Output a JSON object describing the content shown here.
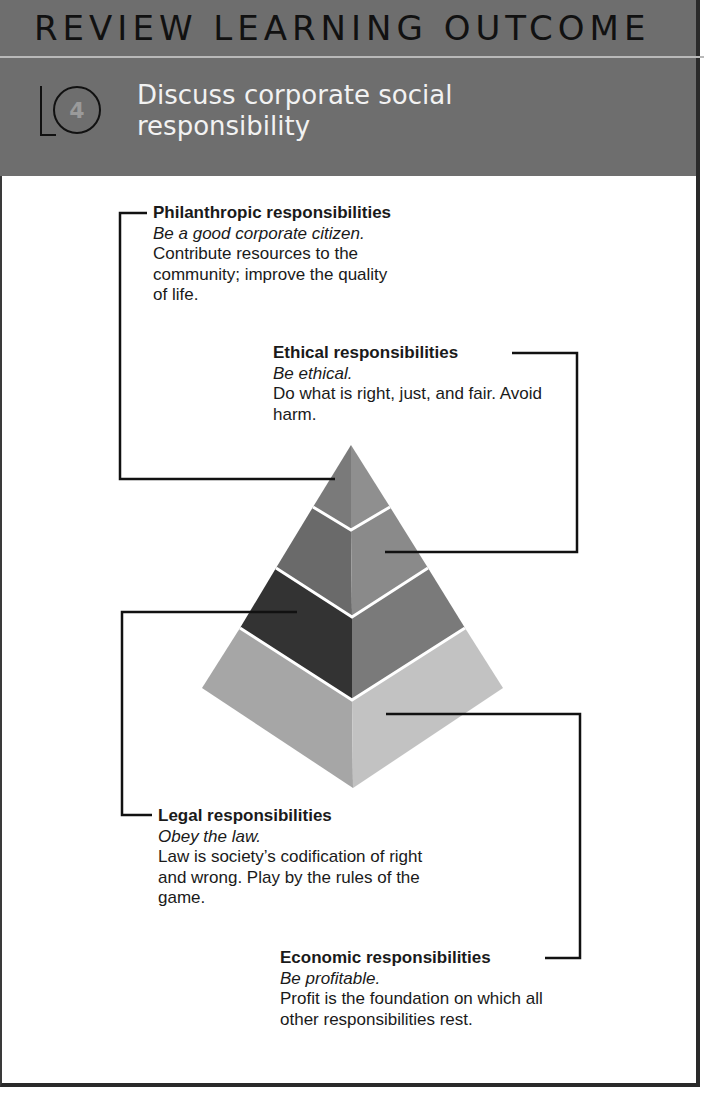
{
  "header": {
    "title": "REVIEW LEARNING OUTCOME",
    "lo_label": "LO",
    "lo_number": "4",
    "objective": "Discuss corporate social responsibility",
    "background_color": "#6e6e6e"
  },
  "pyramid": {
    "levels": [
      {
        "position": "top",
        "heading": "Philanthropic responsibilities",
        "tagline": "Be a good corporate citizen.",
        "description": "Contribute resources to the community; improve the quality of life.",
        "color_left": "#7a7a7a",
        "color_right": "#8f8f8f"
      },
      {
        "position": "second",
        "heading": "Ethical responsibilities",
        "tagline": "Be ethical.",
        "description": "Do what is right, just, and fair. Avoid harm.",
        "color_left": "#6a6a6a",
        "color_right": "#8a8a8a"
      },
      {
        "position": "third",
        "heading": "Legal responsibilities",
        "tagline": "Obey the law.",
        "description": "Law is society’s codification of right and wrong. Play by the rules of the game.",
        "color_left": "#333333",
        "color_right": "#7a7a7a"
      },
      {
        "position": "base",
        "heading": "Economic responsibilities",
        "tagline": "Be profitable.",
        "description": "Profit is the foundation on which all other responsibilities rest.",
        "color_left": "#a6a6a6",
        "color_right": "#c2c2c2"
      }
    ]
  }
}
